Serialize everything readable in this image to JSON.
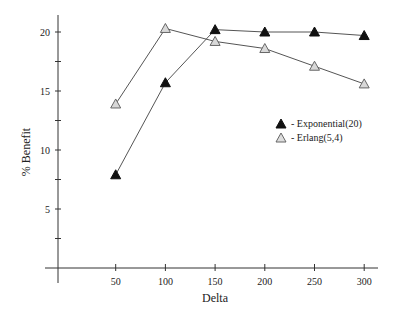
{
  "chart_data": {
    "type": "line",
    "title": "",
    "xlabel": "Delta",
    "ylabel": "% Benefit",
    "x": [
      50,
      100,
      150,
      200,
      250,
      300
    ],
    "x_tick_labels": [
      "50",
      "100",
      "150",
      "200",
      "250",
      "300"
    ],
    "y_tick_labels": [
      "5",
      "10",
      "15",
      "20"
    ],
    "y_minor_ticks": [
      2.5,
      7.5,
      12.5,
      17.5
    ],
    "xlim": [
      0,
      320
    ],
    "ylim": [
      0,
      21
    ],
    "grid": false,
    "legend_position": "right-middle",
    "series": [
      {
        "name": "- Exponential(20)",
        "marker": "filled-triangle",
        "color": "#111111",
        "values": [
          7.9,
          15.7,
          20.2,
          20.0,
          20.0,
          19.7
        ]
      },
      {
        "name": "- Erlang(5,4)",
        "marker": "hollow-triangle",
        "color": "#888888",
        "values": [
          13.9,
          20.3,
          19.2,
          18.6,
          17.1,
          15.6
        ]
      }
    ]
  }
}
